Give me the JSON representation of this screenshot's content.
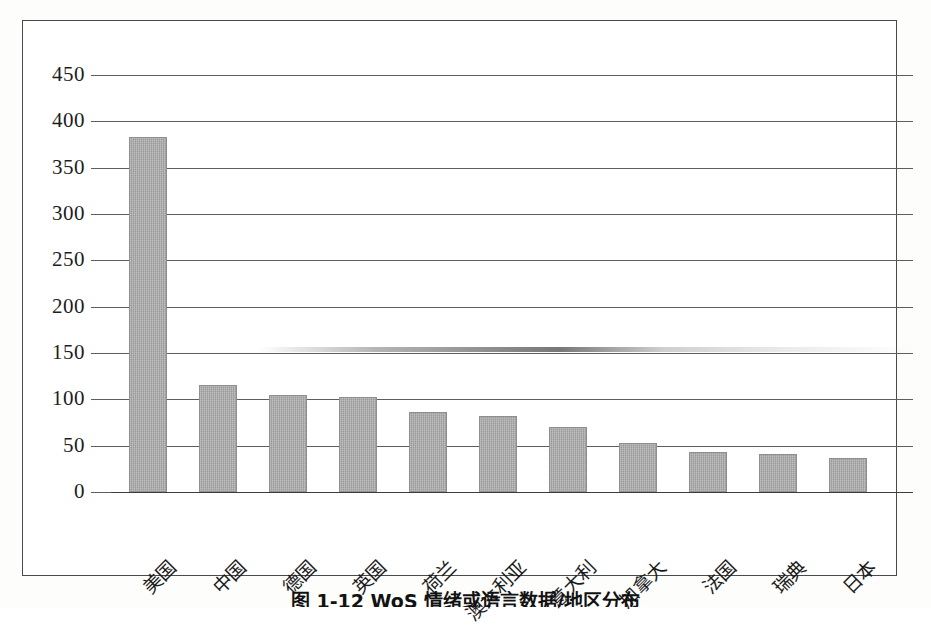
{
  "chart_data": {
    "type": "bar",
    "title": "",
    "xlabel": "",
    "ylabel": "",
    "categories": [
      "美国",
      "中国",
      "德国",
      "英国",
      "荷兰",
      "澳大利亚",
      "意大利",
      "加拿大",
      "法国",
      "瑞典",
      "日本"
    ],
    "values": [
      383,
      115,
      105,
      103,
      86,
      82,
      70,
      53,
      43,
      41,
      37
    ],
    "series": [
      {
        "name": "发文量",
        "values": [
          383,
          115,
          105,
          103,
          86,
          82,
          70,
          53,
          43,
          41,
          37
        ]
      }
    ],
    "ylim": [
      0,
      450
    ],
    "ytick_values": [
      0,
      50,
      100,
      150,
      200,
      250,
      300,
      350,
      400,
      450
    ],
    "ytick_labels": [
      "0",
      "50",
      "100",
      "150",
      "200",
      "250",
      "300",
      "350",
      "400",
      "450"
    ],
    "grid": true,
    "legend": "none",
    "bar_color": "#a9a9a9",
    "bar_border_color": "#8f8f8f",
    "gridline_color": "#5e5e5e",
    "frame_color": "#4a4a4a",
    "text_color": "#1b1b1b"
  },
  "figure": {
    "caption": "图 1-12  WoS 情绪或语言数据/地区分布"
  },
  "artifacts": {
    "scan_smear_label": "scan-smear-near-150"
  }
}
